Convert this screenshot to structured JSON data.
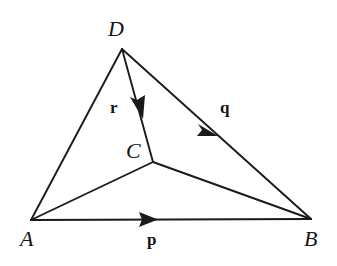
{
  "figure": {
    "type": "geometry-vector-diagram",
    "width": 337,
    "height": 266,
    "background_color": "#ffffff",
    "stroke_color": "#1a1a1a",
    "text_color": "#151515",
    "stroke_width": 1.8
  },
  "points": [
    {
      "id": "D",
      "label": "D",
      "x": 122,
      "y": 49,
      "label_x": 108,
      "label_y": 18
    },
    {
      "id": "A",
      "label": "A",
      "x": 31,
      "y": 220,
      "label_x": 20,
      "label_y": 228
    },
    {
      "id": "B",
      "label": "B",
      "x": 311,
      "y": 219,
      "label_x": 304,
      "label_y": 228
    },
    {
      "id": "C",
      "label": "C",
      "x": 153,
      "y": 162,
      "label_x": 126,
      "label_y": 140
    }
  ],
  "segments": [
    {
      "id": "AD",
      "from": "A",
      "to": "D",
      "x1": 31,
      "y1": 220,
      "x2": 122,
      "y2": 49,
      "arrow": false
    },
    {
      "id": "DC",
      "from": "D",
      "to": "C",
      "x1": 122,
      "y1": 49,
      "x2": 153,
      "y2": 162,
      "arrow": true
    },
    {
      "id": "DB",
      "from": "D",
      "to": "B",
      "x1": 122,
      "y1": 49,
      "x2": 311,
      "y2": 219,
      "arrow": true
    },
    {
      "id": "AB",
      "from": "A",
      "to": "B",
      "x1": 31,
      "y1": 220,
      "x2": 311,
      "y2": 219,
      "arrow": true
    },
    {
      "id": "AC",
      "from": "A",
      "to": "C",
      "x1": 31,
      "y1": 220,
      "x2": 153,
      "y2": 162,
      "arrow": false
    },
    {
      "id": "CB",
      "from": "C",
      "to": "B",
      "x1": 153,
      "y1": 162,
      "x2": 311,
      "y2": 219,
      "arrow": false
    }
  ],
  "vectors": [
    {
      "id": "p",
      "label": "p",
      "on_segment": "AB",
      "arrow_tip_x": 155,
      "arrow_tip_y": 220,
      "label_x": 147,
      "label_y": 231
    },
    {
      "id": "q",
      "label": "q",
      "on_segment": "DB",
      "arrow_tip_x": 216,
      "arrow_tip_y": 134,
      "label_x": 220,
      "label_y": 99
    },
    {
      "id": "r",
      "label": "r",
      "on_segment": "DC",
      "arrow_tip_x": 143,
      "arrow_tip_y": 117,
      "label_x": 110,
      "label_y": 99
    }
  ]
}
